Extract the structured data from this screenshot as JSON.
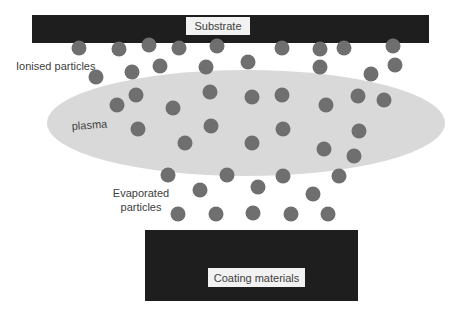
{
  "diagram": {
    "colors": {
      "bar": "#1e1e1e",
      "label_box": "#f2f2f2",
      "plasma": "#d9d9d9",
      "particle": "#6f6f6f",
      "text": "#404040"
    },
    "substrate": {
      "label": "Substrate",
      "rect": {
        "x": 32,
        "y": 15,
        "w": 397,
        "h": 28
      },
      "label_box": {
        "x": 186,
        "y": 17,
        "w": 64,
        "h": 18
      }
    },
    "coating": {
      "label": "Coating materials",
      "rect": {
        "x": 145,
        "y": 230,
        "w": 213,
        "h": 71
      },
      "label_box": {
        "x": 208,
        "y": 268,
        "w": 97,
        "h": 19
      }
    },
    "plasma": {
      "label": "plasma",
      "ellipse": {
        "cx": 246,
        "cy": 123,
        "rx": 199,
        "ry": 53
      },
      "label_pos": {
        "x": 72,
        "y": 130
      }
    },
    "labels": {
      "ionised": {
        "text": "Ionised particles",
        "x": 16,
        "y": 70
      },
      "evaporated_line1": {
        "text": "Evaporated",
        "x": 141,
        "y": 197
      },
      "evaporated_line2": {
        "text": "particles",
        "x": 141,
        "y": 211
      }
    },
    "particles": {
      "radius": 7.5,
      "ionised": [
        [
          79,
          48
        ],
        [
          119,
          49
        ],
        [
          149,
          45
        ],
        [
          179,
          48
        ],
        [
          217,
          46
        ],
        [
          282,
          48
        ],
        [
          320,
          49
        ],
        [
          344,
          48
        ],
        [
          393,
          46
        ],
        [
          96,
          77
        ],
        [
          132,
          72
        ],
        [
          160,
          66
        ],
        [
          206,
          67
        ],
        [
          248,
          62
        ],
        [
          320,
          67
        ],
        [
          371,
          74
        ],
        [
          395,
          65
        ]
      ],
      "plasma": [
        [
          117,
          105
        ],
        [
          136,
          95
        ],
        [
          173,
          108
        ],
        [
          210,
          92
        ],
        [
          252,
          97
        ],
        [
          282,
          95
        ],
        [
          326,
          105
        ],
        [
          358,
          96
        ],
        [
          384,
          100
        ],
        [
          138,
          129
        ],
        [
          211,
          126
        ],
        [
          283,
          129
        ],
        [
          359,
          131
        ],
        [
          185,
          143
        ],
        [
          252,
          143
        ],
        [
          324,
          149
        ],
        [
          354,
          156
        ]
      ],
      "evaporated": [
        [
          168,
          175
        ],
        [
          227,
          175
        ],
        [
          283,
          176
        ],
        [
          339,
          176
        ],
        [
          200,
          190
        ],
        [
          258,
          187
        ],
        [
          313,
          194
        ],
        [
          178,
          214
        ],
        [
          216,
          214
        ],
        [
          253,
          213
        ],
        [
          291,
          214
        ],
        [
          328,
          214
        ]
      ]
    }
  }
}
